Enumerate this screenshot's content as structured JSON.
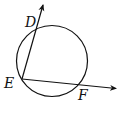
{
  "diagram": {
    "type": "geometry",
    "labels": {
      "D": "D",
      "E": "E",
      "F": "F"
    },
    "colors": {
      "stroke": "#111111",
      "background": "#ffffff"
    }
  }
}
